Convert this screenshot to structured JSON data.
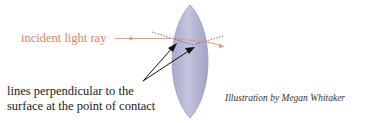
{
  "diagram": {
    "labels": {
      "incident_ray": "incident light ray",
      "perpendicular_line1": "lines perpendicular to the",
      "perpendicular_line2": "surface at the point of contact",
      "credit": "Illustration by Megan Whitaker"
    },
    "colors": {
      "ray": "#f08a6c",
      "lens_fill": "#b4b4d2",
      "lens_edge": "#9a9ac0",
      "arrow": "#111111",
      "normal_dotted": "#555555"
    }
  }
}
